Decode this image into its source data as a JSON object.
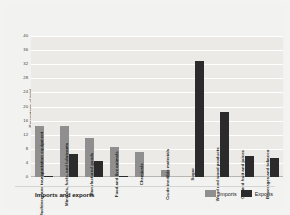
{
  "chart_data": {
    "type": "bar",
    "title": "",
    "xlabel": "Imports and exports",
    "ylabel": "Percentage of total",
    "ylim": [
      0,
      40
    ],
    "yticks": [
      0,
      4,
      8,
      12,
      16,
      20,
      24,
      28,
      32,
      36,
      40
    ],
    "grid": true,
    "legend_position": "bottom-right",
    "categories": [
      "Machinery and transportation equipment",
      "Minerals, fuels, and lubricants",
      "Manufactured goods",
      "Food and live animals",
      "Chemicals",
      "Crude inedible materials",
      "Sugar",
      "Wood and wood products",
      "Canned fruit and juices",
      "Beverages and tobacco"
    ],
    "series": [
      {
        "name": "Imports",
        "color": "#8f8f8f",
        "values": [
          14.5,
          14.5,
          11.0,
          8.5,
          7.0,
          2.0,
          0,
          0,
          0,
          0
        ]
      },
      {
        "name": "Exports",
        "color": "#2b2b2b",
        "values": [
          0.4,
          6.5,
          4.5,
          0.4,
          0,
          0,
          33.0,
          18.5,
          6.0,
          5.5
        ]
      }
    ]
  },
  "legend": {
    "items": [
      {
        "label": "Imports",
        "swatch": "imports"
      },
      {
        "label": "Exports",
        "swatch": "exports"
      }
    ]
  }
}
